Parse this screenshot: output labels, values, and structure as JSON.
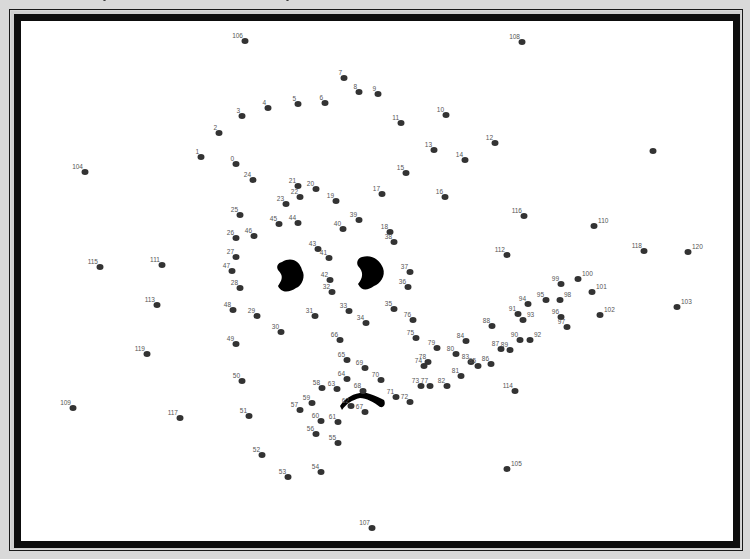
{
  "puzzle": {
    "title": "Connect-the-dots puzzle",
    "dots": [
      {
        "n": "0",
        "x": 236,
        "y": 164
      },
      {
        "n": "1",
        "x": 201,
        "y": 157
      },
      {
        "n": "2",
        "x": 219,
        "y": 133
      },
      {
        "n": "3",
        "x": 242,
        "y": 116
      },
      {
        "n": "4",
        "x": 268,
        "y": 108
      },
      {
        "n": "5",
        "x": 298,
        "y": 104
      },
      {
        "n": "6",
        "x": 325,
        "y": 103
      },
      {
        "n": "7",
        "x": 344,
        "y": 78
      },
      {
        "n": "8",
        "x": 359,
        "y": 92
      },
      {
        "n": "9",
        "x": 378,
        "y": 94
      },
      {
        "n": "10",
        "x": 446,
        "y": 115
      },
      {
        "n": "11",
        "x": 401,
        "y": 123
      },
      {
        "n": "12",
        "x": 495,
        "y": 143
      },
      {
        "n": "13",
        "x": 434,
        "y": 150
      },
      {
        "n": "14",
        "x": 465,
        "y": 160
      },
      {
        "n": "15",
        "x": 406,
        "y": 173
      },
      {
        "n": "16",
        "x": 445,
        "y": 197
      },
      {
        "n": "17",
        "x": 382,
        "y": 194
      },
      {
        "n": "18",
        "x": 390,
        "y": 232
      },
      {
        "n": "19",
        "x": 336,
        "y": 201
      },
      {
        "n": "20",
        "x": 316,
        "y": 189
      },
      {
        "n": "21",
        "x": 298,
        "y": 186
      },
      {
        "n": "22",
        "x": 300,
        "y": 197
      },
      {
        "n": "23",
        "x": 286,
        "y": 204
      },
      {
        "n": "24",
        "x": 253,
        "y": 180
      },
      {
        "n": "25",
        "x": 240,
        "y": 215
      },
      {
        "n": "26",
        "x": 236,
        "y": 238
      },
      {
        "n": "27",
        "x": 236,
        "y": 257
      },
      {
        "n": "28",
        "x": 240,
        "y": 288
      },
      {
        "n": "29",
        "x": 257,
        "y": 316
      },
      {
        "n": "30",
        "x": 281,
        "y": 332
      },
      {
        "n": "31",
        "x": 315,
        "y": 316
      },
      {
        "n": "32",
        "x": 332,
        "y": 292
      },
      {
        "n": "33",
        "x": 349,
        "y": 311
      },
      {
        "n": "34",
        "x": 366,
        "y": 323
      },
      {
        "n": "35",
        "x": 394,
        "y": 309
      },
      {
        "n": "36",
        "x": 408,
        "y": 287
      },
      {
        "n": "37",
        "x": 410,
        "y": 272
      },
      {
        "n": "38",
        "x": 394,
        "y": 242
      },
      {
        "n": "39",
        "x": 359,
        "y": 220
      },
      {
        "n": "40",
        "x": 343,
        "y": 229
      },
      {
        "n": "41",
        "x": 329,
        "y": 258
      },
      {
        "n": "42",
        "x": 330,
        "y": 280
      },
      {
        "n": "43",
        "x": 318,
        "y": 249
      },
      {
        "n": "44",
        "x": 298,
        "y": 223
      },
      {
        "n": "45",
        "x": 279,
        "y": 224
      },
      {
        "n": "46",
        "x": 254,
        "y": 236
      },
      {
        "n": "47",
        "x": 232,
        "y": 271
      },
      {
        "n": "48",
        "x": 233,
        "y": 310
      },
      {
        "n": "49",
        "x": 236,
        "y": 344
      },
      {
        "n": "50",
        "x": 242,
        "y": 381
      },
      {
        "n": "51",
        "x": 249,
        "y": 416
      },
      {
        "n": "52",
        "x": 262,
        "y": 455
      },
      {
        "n": "53",
        "x": 288,
        "y": 477
      },
      {
        "n": "54",
        "x": 321,
        "y": 472
      },
      {
        "n": "55",
        "x": 338,
        "y": 443
      },
      {
        "n": "56",
        "x": 316,
        "y": 434
      },
      {
        "n": "57",
        "x": 300,
        "y": 410
      },
      {
        "n": "58",
        "x": 322,
        "y": 388
      },
      {
        "n": "59",
        "x": 312,
        "y": 403
      },
      {
        "n": "60",
        "x": 321,
        "y": 421
      },
      {
        "n": "61",
        "x": 338,
        "y": 422
      },
      {
        "n": "62",
        "x": 351,
        "y": 406
      },
      {
        "n": "63",
        "x": 337,
        "y": 389
      },
      {
        "n": "64",
        "x": 347,
        "y": 379
      },
      {
        "n": "65",
        "x": 347,
        "y": 360
      },
      {
        "n": "66",
        "x": 340,
        "y": 340
      },
      {
        "n": "67",
        "x": 365,
        "y": 412
      },
      {
        "n": "68",
        "x": 363,
        "y": 391
      },
      {
        "n": "69",
        "x": 365,
        "y": 368
      },
      {
        "n": "70",
        "x": 381,
        "y": 380
      },
      {
        "n": "71",
        "x": 396,
        "y": 397
      },
      {
        "n": "72",
        "x": 410,
        "y": 402
      },
      {
        "n": "73",
        "x": 421,
        "y": 386
      },
      {
        "n": "74",
        "x": 424,
        "y": 366
      },
      {
        "n": "75",
        "x": 416,
        "y": 338
      },
      {
        "n": "76",
        "x": 413,
        "y": 320
      },
      {
        "n": "77",
        "x": 430,
        "y": 386
      },
      {
        "n": "78",
        "x": 428,
        "y": 362
      },
      {
        "n": "79",
        "x": 437,
        "y": 348
      },
      {
        "n": "80",
        "x": 456,
        "y": 354
      },
      {
        "n": "81",
        "x": 461,
        "y": 376
      },
      {
        "n": "82",
        "x": 447,
        "y": 386
      },
      {
        "n": "83",
        "x": 471,
        "y": 362
      },
      {
        "n": "84",
        "x": 466,
        "y": 341
      },
      {
        "n": "85",
        "x": 478,
        "y": 366
      },
      {
        "n": "86",
        "x": 491,
        "y": 364
      },
      {
        "n": "87",
        "x": 501,
        "y": 349
      },
      {
        "n": "88",
        "x": 492,
        "y": 326
      },
      {
        "n": "89",
        "x": 510,
        "y": 350
      },
      {
        "n": "90",
        "x": 520,
        "y": 340
      },
      {
        "n": "91",
        "x": 518,
        "y": 314
      },
      {
        "n": "92",
        "x": 530,
        "y": 340
      },
      {
        "n": "93",
        "x": 523,
        "y": 320
      },
      {
        "n": "94",
        "x": 528,
        "y": 304
      },
      {
        "n": "95",
        "x": 546,
        "y": 300
      },
      {
        "n": "96",
        "x": 561,
        "y": 317
      },
      {
        "n": "97",
        "x": 567,
        "y": 327
      },
      {
        "n": "98",
        "x": 560,
        "y": 300
      },
      {
        "n": "99",
        "x": 561,
        "y": 284
      },
      {
        "n": "100",
        "x": 578,
        "y": 279
      },
      {
        "n": "101",
        "x": 592,
        "y": 292
      },
      {
        "n": "102",
        "x": 600,
        "y": 315
      },
      {
        "n": "103",
        "x": 677,
        "y": 307
      },
      {
        "n": "104",
        "x": 85,
        "y": 172
      },
      {
        "n": "105",
        "x": 507,
        "y": 469
      },
      {
        "n": "106",
        "x": 245,
        "y": 41
      },
      {
        "n": "107",
        "x": 372,
        "y": 528
      },
      {
        "n": "108",
        "x": 522,
        "y": 42
      },
      {
        "n": "109",
        "x": 73,
        "y": 408
      },
      {
        "n": "110",
        "x": 594,
        "y": 226
      },
      {
        "n": "111",
        "x": 162,
        "y": 265
      },
      {
        "n": "112",
        "x": 507,
        "y": 255
      },
      {
        "n": "113",
        "x": 157,
        "y": 305
      },
      {
        "n": "114",
        "x": 515,
        "y": 391
      },
      {
        "n": "115",
        "x": 100,
        "y": 267
      },
      {
        "n": "116",
        "x": 524,
        "y": 216
      },
      {
        "n": "117",
        "x": 180,
        "y": 418
      },
      {
        "n": "118",
        "x": 644,
        "y": 251
      },
      {
        "n": "119",
        "x": 147,
        "y": 354
      },
      {
        "n": "120",
        "x": 688,
        "y": 252
      },
      {
        "n": "",
        "x": 653,
        "y": 151
      }
    ],
    "right_labels": [
      "105",
      "120",
      "103",
      "102",
      "101",
      "100",
      "98",
      "93",
      "92",
      "110"
    ],
    "top_cut_text": "…partially visible heading (cropped)"
  },
  "frame": {
    "outer_bg": "#d9d9d9",
    "border": "#0d0d0d",
    "paper": "#ffffff",
    "dot": "#333333",
    "label": "#555555"
  }
}
